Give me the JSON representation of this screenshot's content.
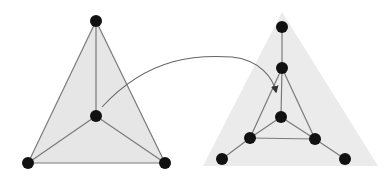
{
  "diagram": {
    "type": "graph-transformation",
    "colors": {
      "background": "#ffffff",
      "left_fill": "#e6e6e6",
      "right_fill": "#ebebeb",
      "edge": "#7a7a7a",
      "node": "#111111",
      "arrow": "#666666"
    },
    "left_graph": {
      "fill_polygon": [
        [
          96,
          21
        ],
        [
          28,
          163
        ],
        [
          165,
          163
        ]
      ],
      "nodes": [
        {
          "id": "L_top",
          "x": 96,
          "y": 21
        },
        {
          "id": "L_center",
          "x": 96,
          "y": 116
        },
        {
          "id": "L_bl",
          "x": 28,
          "y": 163
        },
        {
          "id": "L_br",
          "x": 165,
          "y": 163
        }
      ],
      "edges": [
        [
          "L_top",
          "L_bl"
        ],
        [
          "L_top",
          "L_br"
        ],
        [
          "L_bl",
          "L_br"
        ],
        [
          "L_top",
          "L_center"
        ],
        [
          "L_center",
          "L_bl"
        ],
        [
          "L_center",
          "L_br"
        ]
      ]
    },
    "right_graph": {
      "fill_polygon": [
        [
          282,
          12
        ],
        [
          203,
          166
        ],
        [
          378,
          166
        ]
      ],
      "nodes": [
        {
          "id": "R_top",
          "x": 282,
          "y": 27
        },
        {
          "id": "R_upper",
          "x": 282,
          "y": 68
        },
        {
          "id": "R_center",
          "x": 281,
          "y": 117
        },
        {
          "id": "R_il",
          "x": 250,
          "y": 138
        },
        {
          "id": "R_ir",
          "x": 315,
          "y": 139
        },
        {
          "id": "R_ol",
          "x": 222,
          "y": 159
        },
        {
          "id": "R_or",
          "x": 345,
          "y": 159
        }
      ],
      "edges": [
        [
          "R_top",
          "R_upper"
        ],
        [
          "R_upper",
          "R_il"
        ],
        [
          "R_upper",
          "R_ir"
        ],
        [
          "R_il",
          "R_ir"
        ],
        [
          "R_upper",
          "R_center"
        ],
        [
          "R_center",
          "R_il"
        ],
        [
          "R_center",
          "R_ir"
        ],
        [
          "R_il",
          "R_ol"
        ],
        [
          "R_ir",
          "R_or"
        ]
      ]
    },
    "arrow": {
      "from": "L_center",
      "to": "R_inner_triangle",
      "path": "M 102 107 C 150 55, 200 55, 232 57 C 260 60, 273 78, 276 92"
    },
    "node_radius": 6
  }
}
